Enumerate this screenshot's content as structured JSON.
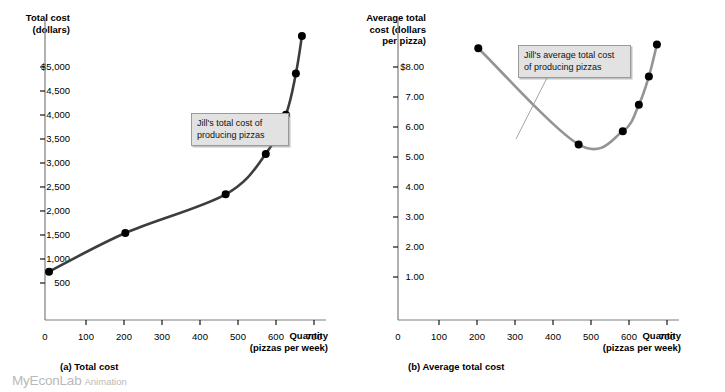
{
  "figure": {
    "brand_name": "MyEconLab",
    "brand_suffix": "Animation",
    "brand_color": "#b9b9b9",
    "background": "#ffffff"
  },
  "panels": [
    {
      "id": "a",
      "caption": "(a) Total cost",
      "callout": "Jill's total cost of\nproducing pizzas",
      "curve_color": "#3d3d3d",
      "point_color": "#000000"
    },
    {
      "id": "b",
      "caption": "(b) Average total cost",
      "callout": "Jill's average total cost\nof producing pizzas",
      "curve_color": "#949494",
      "point_color": "#000000"
    }
  ],
  "chart_data": [
    {
      "type": "line",
      "title": "(a) Total cost",
      "ylabel": "Total cost\n(dollars)",
      "xlabel": "Quantity\n(pizzas per week)",
      "xlim": [
        0,
        700
      ],
      "ylim": [
        0,
        5000
      ],
      "xticks": [
        0,
        100,
        200,
        300,
        400,
        500,
        600,
        700
      ],
      "xticklabels": [
        "0",
        "100",
        "200",
        "300",
        "400",
        "500",
        "600",
        "700"
      ],
      "yticks": [
        500,
        1000,
        1500,
        2000,
        2500,
        3000,
        3500,
        4000,
        4500,
        5000
      ],
      "yticklabels": [
        "500",
        "1,000",
        "1,500",
        "2,000",
        "2,500",
        "3,000",
        "3,500",
        "4,000",
        "4,500",
        "$5,000"
      ],
      "grid": false,
      "legend": false,
      "series": [
        {
          "name": "Jill's total cost of producing pizzas",
          "color": "#3d3d3d",
          "x": [
            10,
            200,
            450,
            550,
            600,
            625,
            640
          ],
          "y": [
            800,
            1440,
            2080,
            2750,
            3400,
            4080,
            4700
          ],
          "markers": true
        }
      ],
      "annotations": [
        {
          "text": "Jill's total cost of producing pizzas",
          "points_to": {
            "x": 625,
            "y": 3700
          }
        }
      ]
    },
    {
      "type": "line",
      "title": "(b) Average total cost",
      "ylabel": "Average total\ncost (dollars\nper pizza)",
      "xlabel": "Quantity\n(pizzas per week)",
      "xlim": [
        0,
        700
      ],
      "ylim": [
        0,
        8.0
      ],
      "xticks": [
        0,
        100,
        200,
        300,
        400,
        500,
        600,
        700
      ],
      "xticklabels": [
        "0",
        "100",
        "200",
        "300",
        "400",
        "500",
        "600",
        "700"
      ],
      "yticks": [
        1.0,
        2.0,
        3.0,
        4.0,
        5.0,
        6.0,
        7.0,
        8.0
      ],
      "yticklabels": [
        "1.00",
        "2.00",
        "3.00",
        "4.00",
        "5.00",
        "6.00",
        "7.00",
        "$8.00"
      ],
      "grid": false,
      "legend": false,
      "series": [
        {
          "name": "Jill's average total cost of producing pizzas",
          "color": "#949494",
          "x": [
            200,
            450,
            560,
            600,
            625,
            645
          ],
          "y": [
            7.2,
            4.65,
            5.0,
            5.7,
            6.45,
            7.3
          ],
          "markers": true
        }
      ],
      "annotations": [
        {
          "text": "Jill's average total cost of producing pizzas",
          "points_to": {
            "x": 380,
            "y": 5.05
          }
        }
      ]
    }
  ]
}
